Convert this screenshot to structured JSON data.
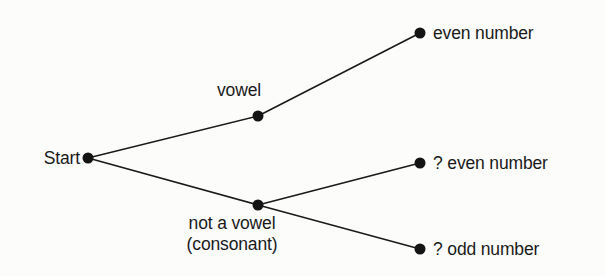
{
  "figure": {
    "type": "probability-tree-diagram",
    "width": 606,
    "height": 276,
    "background_color": "#fcfcfa",
    "ink_color": "#1a1a1a",
    "node_color": "#141414"
  },
  "nodes": [
    {
      "id": "start",
      "label": "Start",
      "x": 88,
      "y": 158,
      "label_x": 80,
      "label_y": 158,
      "label_pos": "left"
    },
    {
      "id": "vowel",
      "label": "vowel",
      "x": 258,
      "y": 116,
      "label_x": 239,
      "label_y": 80,
      "label_pos": "center"
    },
    {
      "id": "consonant",
      "label": "not a vowel\n(consonant)",
      "x": 258,
      "y": 205,
      "label_x": 232,
      "label_y": 213,
      "label_pos": "center"
    },
    {
      "id": "even",
      "label": "even number",
      "x": 420,
      "y": 33,
      "label_x": 433,
      "label_y": 33,
      "label_pos": "right"
    },
    {
      "id": "even_q",
      "label": "? even number",
      "x": 420,
      "y": 163,
      "label_x": 433,
      "label_y": 163,
      "label_pos": "right"
    },
    {
      "id": "odd_q",
      "label": "? odd number",
      "x": 420,
      "y": 249,
      "label_x": 433,
      "label_y": 249,
      "label_pos": "right"
    }
  ],
  "edges": [
    {
      "id": "start-vowel",
      "from": "start",
      "to": "vowel",
      "x1": 88,
      "y1": 158,
      "x2": 258,
      "y2": 116
    },
    {
      "id": "start-consonant",
      "from": "start",
      "to": "consonant",
      "x1": 88,
      "y1": 158,
      "x2": 258,
      "y2": 205
    },
    {
      "id": "vowel-even",
      "from": "vowel",
      "to": "even",
      "x1": 258,
      "y1": 116,
      "x2": 420,
      "y2": 33
    },
    {
      "id": "consonant-even-q",
      "from": "consonant",
      "to": "even_q",
      "x1": 258,
      "y1": 205,
      "x2": 420,
      "y2": 163
    },
    {
      "id": "consonant-odd-q",
      "from": "consonant",
      "to": "odd_q",
      "x1": 258,
      "y1": 205,
      "x2": 420,
      "y2": 249
    }
  ]
}
